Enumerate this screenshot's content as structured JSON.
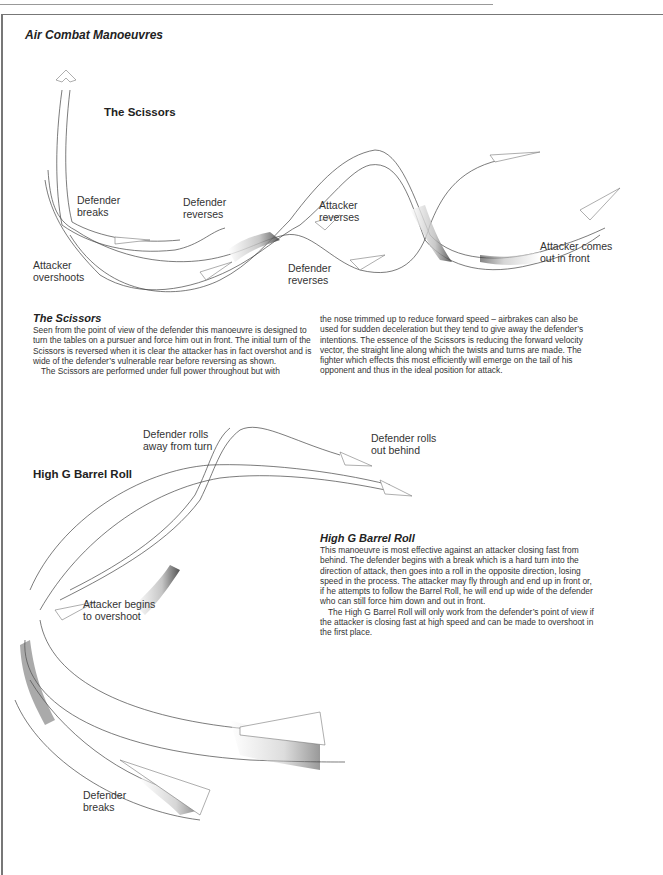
{
  "page": {
    "title": "Air Combat Manoeuvres"
  },
  "scissors": {
    "diagram_title": "The Scissors",
    "labels": {
      "defender_breaks": "Defender\nbreaks",
      "defender_reverses_1": "Defender\nreverses",
      "attacker_reverses": "Attacker\nreverses",
      "attacker_overshoots": "Attacker\novershoots",
      "defender_reverses_2": "Defender\nreverses",
      "attacker_comes_out": "Attacker comes\nout in front"
    },
    "text": {
      "heading": "The Scissors",
      "para1": "Seen from the point of view of the defender this manoeuvre is designed to turn the tables on a pursuer and force him out in front. The initial turn of the Scissors is reversed when it is clear the attacker has in fact overshot and is wide of the defender’s vulnerable rear before reversing as shown.",
      "para2": "The Scissors are performed under full power throughout but with",
      "para3": "the nose trimmed up to reduce forward speed – airbrakes can also be used for sudden deceleration but they tend to give away the defender’s intentions. The essence of the Scissors is reducing the forward velocity vector, the straight line along which the twists and turns are made. The fighter which effects this most efficiently will emerge on the tail of his opponent and thus in the ideal position for attack."
    }
  },
  "barrel_roll": {
    "diagram_title": "High G Barrel Roll",
    "labels": {
      "defender_rolls_away": "Defender rolls\naway from turn",
      "defender_rolls_out": "Defender rolls\nout behind",
      "attacker_begins": "Attacker begins\nto overshoot",
      "defender_breaks": "Defender\nbreaks"
    },
    "text": {
      "heading": "High G Barrel Roll",
      "para1": "This manoeuvre is most effective against an attacker closing fast from behind. The defender begins with a break which is a hard turn into the direction of attack, then goes into a roll in the opposite direction, losing speed in the process. The attacker may fly through and end up in front or, if he attempts to follow the Barrel Roll, he will end up wide of the defender who can still force him down and out in front.",
      "para2": "The High G Barrel Roll will only work from the defender’s point of view if the attacker is closing fast at high speed and can be made to overshoot in the first place."
    }
  }
}
